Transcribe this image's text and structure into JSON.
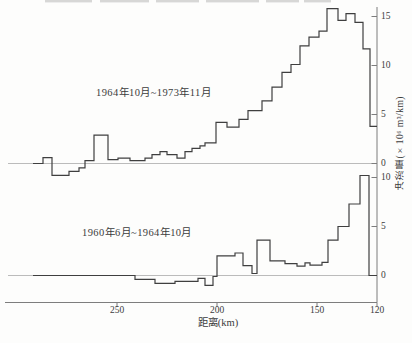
{
  "axes": {
    "x_label": "距离(km)",
    "y_label": "冲淤量(×10⁶ m³/km)",
    "x_ticks": [
      "250",
      "200",
      "150",
      "120"
    ],
    "top_y_ticks": [
      "15",
      "10",
      "5",
      "0"
    ],
    "bottom_y_ticks": [
      "10",
      "5",
      "0"
    ]
  },
  "panels": {
    "top_label": "1964年10月~1973年11月",
    "bottom_label": "1960年6月~1964年10月"
  },
  "colors": {
    "curve": "#3f3f3f",
    "axis": "#7d7d7d",
    "zero_line": "#a9a9a9",
    "text": "#3c3c3c",
    "scan_artifact": "#c9c9c9"
  },
  "decor": {
    "top_dash_segments_x": [
      [
        45,
        92
      ],
      [
        100,
        149
      ],
      [
        156,
        199
      ],
      [
        206,
        259
      ],
      [
        266,
        299
      ],
      [
        304,
        331
      ]
    ]
  },
  "chart_data": [
    {
      "type": "line",
      "subtype": "step-histogram-outline",
      "name": "1964年10月~1973年11月",
      "xlabel": "距离(km)",
      "ylabel": "冲淤量(×10⁶ m³/km)",
      "x_axis_reversed": true,
      "xlim": [
        295,
        120
      ],
      "ylim": [
        -2,
        16.5
      ],
      "y_ticks": [
        0,
        5,
        10,
        15
      ],
      "x_ticks": [
        250,
        200,
        150,
        120
      ],
      "x_edges_km": [
        292,
        287,
        282.5,
        274,
        269,
        266,
        261.5,
        254.5,
        249.5,
        243.5,
        236,
        232.5,
        228.5,
        225,
        220,
        216,
        212.5,
        208.5,
        206,
        200.5,
        195,
        189,
        184.5,
        177.5,
        172.5,
        167.5,
        163,
        158.5,
        154,
        149,
        145,
        139.5,
        135.5,
        131,
        127,
        123.5,
        120
      ],
      "values_10e6_m3_per_km": [
        0,
        0.6,
        -1.2,
        -0.8,
        -0.45,
        0.3,
        2.9,
        0.4,
        0.55,
        0.3,
        0.55,
        0.9,
        1.2,
        0.9,
        0.55,
        1.2,
        1.55,
        1.8,
        2.1,
        4.2,
        3.7,
        4.5,
        5.4,
        6.4,
        7.8,
        9.3,
        10.1,
        12.0,
        12.9,
        13.5,
        15.8,
        14.6,
        15.3,
        14.4,
        11.7,
        3.8
      ]
    },
    {
      "type": "line",
      "subtype": "step-histogram-outline",
      "name": "1960年6月~1964年10月",
      "xlabel": "距离(km)",
      "ylabel": "冲淤量(×10⁶ m³/km)",
      "x_axis_reversed": true,
      "xlim": [
        295,
        120
      ],
      "ylim": [
        -2,
        11
      ],
      "y_ticks": [
        0,
        5,
        10
      ],
      "x_ticks": [
        250,
        200,
        150,
        120
      ],
      "x_edges_km": [
        292,
        241,
        231,
        221,
        209.5,
        206,
        202,
        200,
        191,
        187,
        182.5,
        180,
        173.5,
        166,
        160,
        156,
        153.5,
        147.5,
        144.5,
        139.5,
        134,
        128.5,
        124,
        120
      ],
      "values_10e6_m3_per_km": [
        0,
        -0.4,
        -0.8,
        -0.6,
        -0.3,
        -1.0,
        -0.1,
        2.0,
        2.3,
        1.0,
        0.2,
        3.6,
        1.5,
        1.2,
        0.95,
        1.3,
        1.05,
        1.35,
        3.6,
        5.0,
        7.3,
        10.2,
        0
      ]
    }
  ]
}
